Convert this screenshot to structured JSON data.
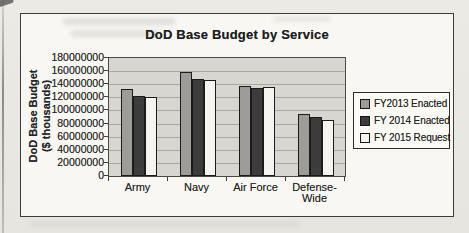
{
  "chart_data": {
    "type": "bar",
    "title": "DoD Base Budget by Service",
    "xlabel": "",
    "ylabel": "DoD Base Budget ($ thousands)",
    "ylabel_lines": [
      "DoD Base Budget",
      "($ thousands)"
    ],
    "categories": [
      "Army",
      "Navy",
      "Air Force",
      "Defense-Wide"
    ],
    "series": [
      {
        "name": "FY2013 Enacted",
        "color": "#9d9c98",
        "values": [
          132000000,
          159000000,
          138000000,
          94000000
        ]
      },
      {
        "name": "FY 2014 Enacted",
        "color": "#3c3c3c",
        "values": [
          122000000,
          148000000,
          134000000,
          90000000
        ]
      },
      {
        "name": "FY 2015 Request",
        "color": "#f5f4f0",
        "values": [
          120000000,
          147000000,
          136000000,
          86000000
        ]
      }
    ],
    "ylim": [
      0,
      180000000
    ],
    "ytick_step": 20000000,
    "yticks": [
      "180000000",
      "160000000",
      "140000000",
      "120000000",
      "100000000",
      "80000000",
      "60000000",
      "40000000",
      "20000000",
      "0"
    ],
    "grid": true,
    "legend_position": "right"
  }
}
